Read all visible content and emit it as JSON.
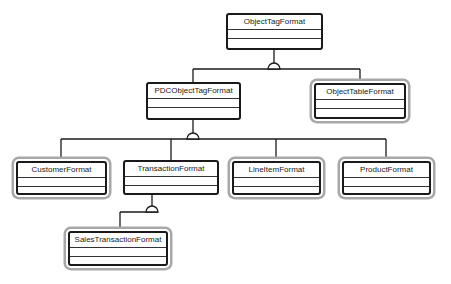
{
  "diagram": {
    "type": "uml-class-hierarchy",
    "classes": [
      {
        "id": "c0",
        "name": "ObjectTagFormat",
        "external": false
      },
      {
        "id": "c1",
        "name": "PDCObjectTagFormat",
        "external": false
      },
      {
        "id": "c2",
        "name": "ObjectTableFormat",
        "external": true
      },
      {
        "id": "c3",
        "name": "CustomerFormat",
        "external": true
      },
      {
        "id": "c4",
        "name": "TransactionFormat",
        "external": false
      },
      {
        "id": "c5",
        "name": "LineItemFormat",
        "external": true
      },
      {
        "id": "c6",
        "name": "ProductFormat",
        "external": true
      },
      {
        "id": "c7",
        "name": "SalesTransactionFormat",
        "external": true
      }
    ],
    "generalizations": [
      {
        "parent": "ObjectTagFormat",
        "children": [
          "PDCObjectTagFormat",
          "ObjectTableFormat"
        ]
      },
      {
        "parent": "PDCObjectTagFormat",
        "children": [
          "CustomerFormat",
          "TransactionFormat",
          "LineItemFormat",
          "ProductFormat"
        ]
      },
      {
        "parent": "TransactionFormat",
        "children": [
          "SalesTransactionFormat"
        ]
      }
    ],
    "colors": {
      "line": "#1a1a1a",
      "halo": "#a8a8a8",
      "background": "#ffffff"
    }
  }
}
